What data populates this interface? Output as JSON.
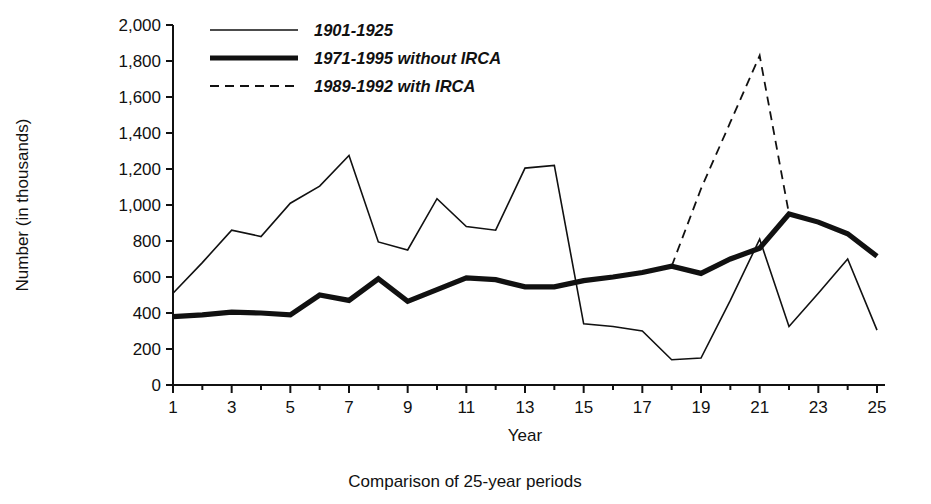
{
  "chart_data": {
    "type": "line",
    "title": "",
    "caption": "Comparison of 25-year periods",
    "xlabel": "Year",
    "ylabel": "Number (in thousands)",
    "xlim": [
      1,
      25
    ],
    "ylim": [
      0,
      2000
    ],
    "grid": false,
    "legend_position": "top-left-inside",
    "x_tick_labels": [
      "1",
      "3",
      "5",
      "7",
      "9",
      "11",
      "13",
      "15",
      "17",
      "19",
      "21",
      "23",
      "25"
    ],
    "x_tick_values": [
      1,
      3,
      5,
      7,
      9,
      11,
      13,
      15,
      17,
      19,
      21,
      23,
      25
    ],
    "x_minor_ticks": [
      2,
      4,
      6,
      8,
      10,
      12,
      14,
      16,
      18,
      20,
      22,
      24
    ],
    "y_tick_labels": [
      "2,000",
      "1,800",
      "1,600",
      "1,400",
      "1,200",
      "1,000",
      "800",
      "600",
      "400",
      "200",
      "0"
    ],
    "y_tick_values": [
      2000,
      1800,
      1600,
      1400,
      1200,
      1000,
      800,
      600,
      400,
      200,
      0
    ],
    "x": [
      1,
      2,
      3,
      4,
      5,
      6,
      7,
      8,
      9,
      10,
      11,
      12,
      13,
      14,
      15,
      16,
      17,
      18,
      19,
      20,
      21,
      22,
      23,
      24,
      25
    ],
    "series": [
      {
        "name": "1901-1925",
        "style": "thin-solid",
        "x": [
          1,
          2,
          3,
          4,
          5,
          6,
          7,
          8,
          9,
          10,
          11,
          12,
          13,
          14,
          15,
          16,
          17,
          18,
          19,
          20,
          21,
          22,
          23,
          24,
          25
        ],
        "values": [
          510,
          680,
          860,
          825,
          1010,
          1105,
          1275,
          795,
          750,
          1035,
          880,
          860,
          1205,
          1220,
          340,
          325,
          300,
          140,
          150,
          470,
          810,
          325,
          510,
          700,
          305
        ]
      },
      {
        "name": "1971-1995 without IRCA",
        "style": "thick-solid",
        "x": [
          1,
          2,
          3,
          4,
          5,
          6,
          7,
          8,
          9,
          10,
          11,
          12,
          13,
          14,
          15,
          16,
          17,
          18,
          19,
          20,
          21,
          22,
          23,
          24,
          25
        ],
        "values": [
          380,
          390,
          405,
          400,
          390,
          500,
          470,
          590,
          465,
          530,
          595,
          585,
          545,
          545,
          580,
          600,
          625,
          660,
          620,
          700,
          760,
          950,
          905,
          840,
          715
        ]
      },
      {
        "name": "1989-1992 with IRCA",
        "style": "dashed",
        "x": [
          18,
          19,
          20,
          21,
          22
        ],
        "values": [
          660,
          1090,
          1460,
          1830,
          950
        ]
      }
    ]
  },
  "legend": {
    "items": [
      {
        "label": "1901-1925",
        "style": "thin-solid"
      },
      {
        "label": "1971-1995 without IRCA",
        "style": "thick-solid"
      },
      {
        "label": "1989-1992 with IRCA",
        "style": "dashed"
      }
    ]
  }
}
